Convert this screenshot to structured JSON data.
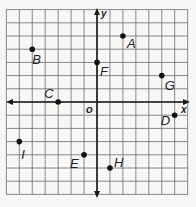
{
  "chart_data": {
    "type": "scatter",
    "title": "",
    "xlabel": "x",
    "ylabel": "y",
    "origin_label": "o",
    "xlim": [
      -7,
      7
    ],
    "ylim": [
      -7,
      7
    ],
    "grid": true,
    "points": [
      {
        "label": "A",
        "x": 2,
        "y": 5
      },
      {
        "label": "B",
        "x": -5,
        "y": 4
      },
      {
        "label": "C",
        "x": -3,
        "y": 0
      },
      {
        "label": "D",
        "x": 6,
        "y": -1
      },
      {
        "label": "E",
        "x": -1,
        "y": -4
      },
      {
        "label": "F",
        "x": 0,
        "y": 3
      },
      {
        "label": "G",
        "x": 5,
        "y": 2
      },
      {
        "label": "H",
        "x": 1,
        "y": -5
      },
      {
        "label": "I",
        "x": -6,
        "y": -3
      }
    ]
  },
  "colors": {
    "grid": "#6a6a6a",
    "axis": "#1a1a1a",
    "point": "#111111",
    "background": "#f7f7f5"
  }
}
